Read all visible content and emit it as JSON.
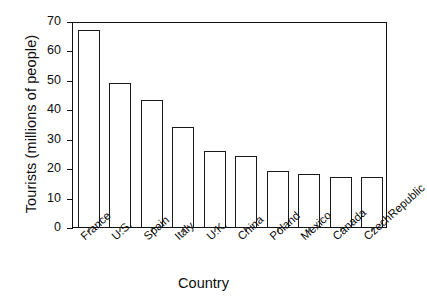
{
  "chart_data": {
    "type": "bar",
    "title": "",
    "xlabel": "Country",
    "ylabel": "Tourists (millions of people)",
    "categories": [
      "France",
      "U.S.",
      "Spain",
      "Italy",
      "U.K.",
      "China",
      "Poland",
      "Mexico",
      "Canada",
      "CzechRepublic"
    ],
    "values": [
      67,
      49,
      43,
      34,
      26,
      24,
      19,
      18,
      17,
      17
    ],
    "ylim": [
      0,
      70
    ],
    "yticks": [
      0,
      10,
      20,
      30,
      40,
      50,
      60,
      70
    ],
    "ytick_labels": [
      "0",
      "10",
      "20",
      "30",
      "40",
      "50",
      "60",
      "70"
    ],
    "grid": false,
    "legend": false,
    "bar_fill_color": "#ffffff",
    "bar_edge_color": "#1a1a1a",
    "axis_color": "#111111",
    "background_color": "#ffffff"
  }
}
